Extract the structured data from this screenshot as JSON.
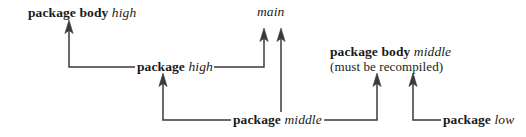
{
  "diagram": {
    "background_color": "#ffffff",
    "line_color": "#3a3a3a",
    "text_color": "#1a1a1a",
    "width": 526,
    "height": 137,
    "nodes": [
      {
        "id": "package-body-high",
        "keyword": "package body",
        "name": "high",
        "note": "",
        "x": 28,
        "y": 5
      },
      {
        "id": "main",
        "keyword": "",
        "name": "main",
        "note": "",
        "x": 257,
        "y": 4
      },
      {
        "id": "package-high",
        "keyword": "package",
        "name": "high",
        "note": "",
        "x": 137,
        "y": 59
      },
      {
        "id": "package-body-middle",
        "keyword": "package body",
        "name": "middle",
        "note": "(must be recompiled)",
        "x": 330,
        "y": 44
      },
      {
        "id": "package-middle",
        "keyword": "package",
        "name": "middle",
        "note": "",
        "x": 233,
        "y": 112
      },
      {
        "id": "package-low",
        "keyword": "package",
        "name": "low",
        "note": "",
        "x": 443,
        "y": 112
      }
    ],
    "edges": [
      {
        "id": "high-body-depends-on-high-spec",
        "from": "package-high",
        "to": "package-body-high",
        "points": "135,67 69,67 69,27",
        "arrow_at": "69,22"
      },
      {
        "id": "main-depends-on-high-spec",
        "from": "package-high",
        "to": "main",
        "points": "214,67 264,67 264,35",
        "arrow_at": "264,30"
      },
      {
        "id": "high-spec-depends-on-middle-spec",
        "from": "package-middle",
        "to": "package-high",
        "points": "231,120 163,120 163,80",
        "arrow_at": "163,75"
      },
      {
        "id": "main-depends-on-middle-spec",
        "from": "package-middle",
        "to": "main",
        "points": "281,110 281,35",
        "arrow_at": "281,30"
      },
      {
        "id": "middle-body-depends-on-middle-spec",
        "from": "package-middle",
        "to": "package-body-middle",
        "points": "324,120 377,120 377,80",
        "arrow_at": "377,75"
      },
      {
        "id": "middle-body-depends-on-low-spec",
        "from": "package-low",
        "to": "package-body-middle",
        "points": "441,120 413,120 413,80",
        "arrow_at": "413,75"
      }
    ]
  }
}
